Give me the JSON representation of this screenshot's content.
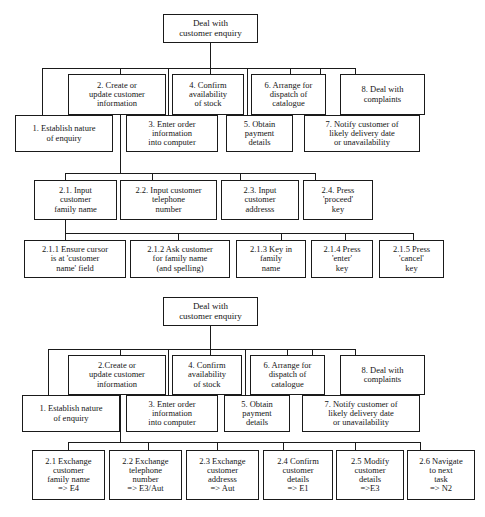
{
  "figure": {
    "type": "hierarchical-task-analysis",
    "diagram_count": 2
  },
  "diagram1": {
    "root": "Deal with\ncustomer enquiry",
    "root_lines": [
      "Deal with",
      "customer enquiry"
    ],
    "level1": [
      {
        "id": "1",
        "label": "1. Establish nature\nof enquiry",
        "lines": [
          "1. Establish nature",
          "of enquiry"
        ],
        "row": "lower"
      },
      {
        "id": "2",
        "label": "2. Create or\nupdate customer\ninformation",
        "lines": [
          "2. Create or",
          "update customer",
          "information"
        ],
        "row": "upper"
      },
      {
        "id": "3",
        "label": "3.  Enter order\ninformation\ninto computer",
        "lines": [
          "3.  Enter order",
          "information",
          "into computer"
        ],
        "row": "lower"
      },
      {
        "id": "4",
        "label": "4. Confirm\navailability\nof stock",
        "lines": [
          "4. Confirm",
          "availability",
          "of stock"
        ],
        "row": "upper"
      },
      {
        "id": "5",
        "label": "5. Obtain\npayment\ndetails",
        "lines": [
          "5. Obtain",
          "payment",
          "details"
        ],
        "row": "lower"
      },
      {
        "id": "6",
        "label": "6. Arrange for\ndispatch of\ncatalogue",
        "lines": [
          "6. Arrange for",
          "dispatch of",
          "catalogue"
        ],
        "row": "upper"
      },
      {
        "id": "7",
        "label": "7. Notify customer of\nlikely delivery date\nor unavailability",
        "lines": [
          "7. Notify customer of",
          "likely delivery date",
          "or unavailability"
        ],
        "row": "lower"
      },
      {
        "id": "8",
        "label": "8. Deal with\ncomplaints",
        "lines": [
          "8. Deal with",
          "complaints"
        ],
        "row": "upper"
      }
    ],
    "level2": [
      {
        "id": "2.1",
        "label": "2.1. Input\ncustomer\nfamily name",
        "lines": [
          "2.1. Input",
          "customer",
          "family name"
        ]
      },
      {
        "id": "2.2",
        "label": "2.2. Input customer\ntelephone\nnumber",
        "lines": [
          "2.2. Input customer",
          "telephone",
          "number"
        ]
      },
      {
        "id": "2.3",
        "label": "2.3. Input\ncustomer\naddresss",
        "lines": [
          "2.3. Input",
          "customer",
          "addresss"
        ]
      },
      {
        "id": "2.4",
        "label": "2.4. Press\n'proceed'\nkey",
        "lines": [
          "2.4. Press",
          "'proceed'",
          "key"
        ]
      }
    ],
    "level3": [
      {
        "id": "2.1.1",
        "label": "2.1.1 Ensure cursor\nis at 'customer\nname' field",
        "lines": [
          "2.1.1 Ensure cursor",
          "is at 'customer",
          "name' field"
        ]
      },
      {
        "id": "2.1.2",
        "label": "2.1.2 Ask customer\nfor family name\n(and spelling)",
        "lines": [
          "2.1.2 Ask customer",
          "for family name",
          "(and spelling)"
        ]
      },
      {
        "id": "2.1.3",
        "label": "2.1.3 Key in\nfamily\nname",
        "lines": [
          "2.1.3 Key in",
          "family",
          "name"
        ]
      },
      {
        "id": "2.1.4",
        "label": "2.1.4 Press\n'enter'\nkey",
        "lines": [
          "2.1.4 Press",
          "'enter'",
          "key"
        ]
      },
      {
        "id": "2.1.5",
        "label": "2.1.5 Press\n'cancel'\nkey",
        "lines": [
          "2.1.5 Press",
          "'cancel'",
          "key"
        ]
      }
    ]
  },
  "diagram2": {
    "root": "Deal with\ncustomer enquiry",
    "root_lines": [
      "Deal with",
      "customer enquiry"
    ],
    "level1": [
      {
        "id": "1",
        "label": "1. Establish nature\nof enquiry",
        "lines": [
          "1. Establish nature",
          "of enquiry"
        ],
        "row": "lower"
      },
      {
        "id": "2",
        "label": "2.Create or\nupdate customer\ninformation",
        "lines": [
          "2.Create or",
          "update customer",
          "information"
        ],
        "row": "upper"
      },
      {
        "id": "3",
        "label": "3.  Enter order\ninformation\ninto computer",
        "lines": [
          "3.  Enter order",
          "information",
          "into computer"
        ],
        "row": "lower"
      },
      {
        "id": "4",
        "label": "4. Confirm\navailability\nof stock",
        "lines": [
          "4. Confirm",
          "availability",
          "of stock"
        ],
        "row": "upper"
      },
      {
        "id": "5",
        "label": "5.  Obtain\npayment\ndetails",
        "lines": [
          "5.  Obtain",
          "payment",
          "details"
        ],
        "row": "lower"
      },
      {
        "id": "6",
        "label": "6. Arrange for\ndispatch of\ncatalogue",
        "lines": [
          "6. Arrange for",
          "dispatch of",
          "catalogue"
        ],
        "row": "upper"
      },
      {
        "id": "7",
        "label": "7.  Notify customer of\nlikely delivery date\nor unavailability",
        "lines": [
          "7.  Notify customer of",
          "likely delivery date",
          "or unavailability"
        ],
        "row": "lower"
      },
      {
        "id": "8",
        "label": "8. Deal with\ncomplaints",
        "lines": [
          "8. Deal with",
          "complaints"
        ],
        "row": "upper"
      }
    ],
    "level2": [
      {
        "id": "2.1",
        "label": "2.1 Exchange\ncustomer\nfamily name\n=>  E4",
        "lines": [
          "2.1 Exchange",
          "customer",
          "family name",
          "=>  E4"
        ],
        "annotation": "=>  E4"
      },
      {
        "id": "2.2",
        "label": "2.2 Exchange\ntelephone\nnumber\n=> E3/Aut",
        "lines": [
          "2.2 Exchange",
          "telephone",
          "number",
          "=> E3/Aut"
        ],
        "annotation": "=> E3/Aut"
      },
      {
        "id": "2.3",
        "label": "2.3 Exchange\ncustomer\naddresss\n=> Aut",
        "lines": [
          "2.3 Exchange",
          "customer",
          "addresss",
          "=> Aut"
        ],
        "annotation": "=> Aut"
      },
      {
        "id": "2.4",
        "label": "2.4 Confirm\ncustomer\ndetails\n=> E1",
        "lines": [
          "2.4 Confirm",
          "customer",
          "details",
          "=> E1"
        ],
        "annotation": "=> E1"
      },
      {
        "id": "2.5",
        "label": "2.5  Modify\ncustomer\ndetails\n=>E3",
        "lines": [
          "2.5  Modify",
          "customer",
          "details",
          "=>E3"
        ],
        "annotation": "=>E3"
      },
      {
        "id": "2.6",
        "label": "2.6 Navigate\nto next\ntask\n=> N2",
        "lines": [
          "2.6 Navigate",
          "to next",
          "task",
          "=> N2"
        ],
        "annotation": "=> N2"
      }
    ]
  },
  "colors": {
    "stroke": "#1a1a1a",
    "background": "#ffffff",
    "text": "#151515"
  }
}
